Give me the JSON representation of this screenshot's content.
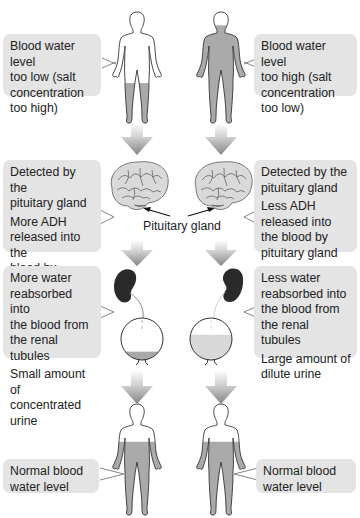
{
  "left_column": {
    "start_state": [
      "Blood water level",
      "too low (salt",
      "concentration",
      "too high)"
    ],
    "detection": {
      "line1": [
        "Detected by the",
        "pituitary gland"
      ],
      "line2": [
        "More ADH",
        "released into the",
        "blood by",
        "pituitary gland"
      ]
    },
    "kidney": {
      "line1": [
        "More water",
        "reabsorbed into",
        "the blood from",
        "the renal tubules"
      ],
      "line2": [
        "Small amount of",
        "concentrated urine"
      ]
    },
    "end_state": [
      "Normal blood",
      "water level"
    ],
    "body_fill_level": "low",
    "bladder_fill_fraction": 0.2
  },
  "right_column": {
    "start_state": [
      "Blood water level",
      "too high (salt",
      "concentration",
      "too low)"
    ],
    "detection": {
      "line1": [
        "Detected by the",
        "pituitary gland"
      ],
      "line2": [
        "Less ADH",
        "released into",
        "the blood by",
        "pituitary gland"
      ]
    },
    "kidney": {
      "line1": [
        "Less water",
        "reabsorbed into",
        "the blood from",
        "the renal tubules"
      ],
      "line2": [
        "Large amount of",
        "dilute urine"
      ]
    },
    "end_state": [
      "Normal blood",
      "water level"
    ],
    "body_fill_level": "high",
    "bladder_fill_fraction": 0.6
  },
  "center_label": "Pituitary gland",
  "colors": {
    "box_bg": "#e4e4e4",
    "fill_gray": "#aaaaaa",
    "urine_concentrated": "#a8a8a8",
    "urine_dilute": "#d8d8d8",
    "kidney": "#2a2a2a",
    "arrow_gray": "#8f8f8f"
  }
}
